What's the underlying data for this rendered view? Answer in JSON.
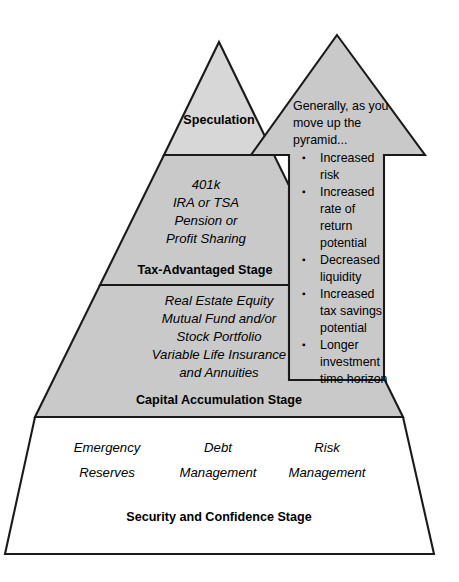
{
  "diagram": {
    "colors": {
      "fill_gray": "#c9c9c9",
      "fill_light_gray": "#d7d7d7",
      "fill_white": "#ffffff",
      "outline": "#1a1a1a",
      "text": "#000000"
    },
    "tiers": [
      {
        "id": "speculation",
        "stage_label": "Speculation",
        "items": []
      },
      {
        "id": "tax-advantaged",
        "stage_label": "Tax-Advantaged Stage",
        "items": [
          "401k",
          "IRA or TSA",
          "Pension or",
          "Profit Sharing"
        ]
      },
      {
        "id": "capital-accumulation",
        "stage_label": "Capital Accumulation Stage",
        "items": [
          "Real Estate Equity",
          "Mutual Fund and/or",
          "Stock Portfolio",
          "Variable Life Insurance",
          "and Annuities"
        ]
      },
      {
        "id": "security-confidence",
        "stage_label": "Security and Confidence Stage",
        "columns": [
          [
            "Emergency",
            "Reserves"
          ],
          [
            "Debt",
            "Management"
          ],
          [
            "Risk",
            "Management"
          ]
        ]
      }
    ],
    "arrow": {
      "intro_lines": [
        "Generally, as you",
        "move up the",
        "pyramid..."
      ],
      "bullets": [
        [
          "Increased",
          "risk"
        ],
        [
          "Increased",
          "rate of",
          "return",
          "potential"
        ],
        [
          "Decreased",
          "liquidity"
        ],
        [
          "Increased",
          "tax savings",
          "potential"
        ],
        [
          "Longer",
          "investment",
          "time horizon"
        ]
      ],
      "bullet_glyph": "▪"
    }
  }
}
